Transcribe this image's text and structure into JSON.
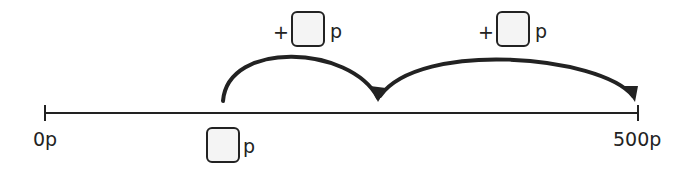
{
  "number_line": {
    "start_label": "0p",
    "end_label": "500p",
    "start_value": 0,
    "end_value": 500,
    "unit": "p"
  },
  "start_box": {
    "value": "",
    "unit": "p"
  },
  "jumps": [
    {
      "operator": "+",
      "value": "",
      "unit": "p"
    },
    {
      "operator": "+",
      "value": "",
      "unit": "p"
    }
  ],
  "colors": {
    "line": "#222222",
    "box_fill": "#f4f4f4"
  }
}
